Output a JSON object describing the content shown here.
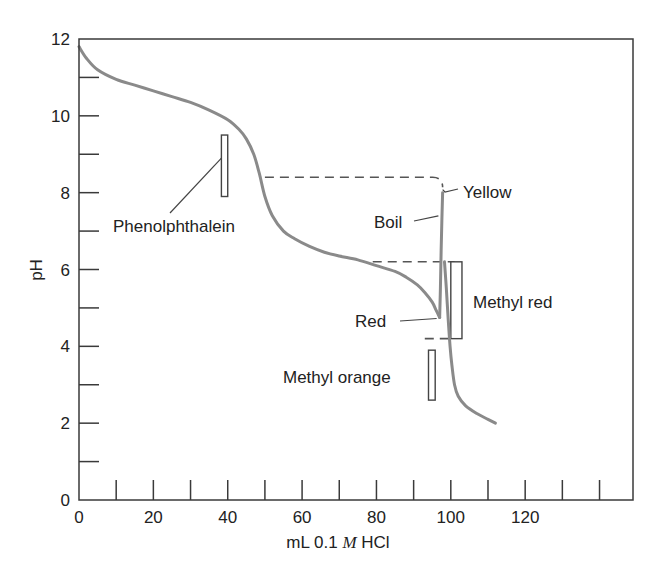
{
  "chart_data": {
    "type": "line",
    "title": "",
    "xlabel_parts": [
      "mL 0.1 ",
      "M",
      " HCl"
    ],
    "xlabel": "mL 0.1 M HCl",
    "ylabel": "pH",
    "xlim": [
      0,
      149
    ],
    "ylim": [
      0,
      12
    ],
    "x_ticks": [
      0,
      10,
      20,
      30,
      40,
      50,
      60,
      70,
      80,
      90,
      100,
      110,
      120,
      130,
      140
    ],
    "x_tick_labels": [
      {
        "value": 0,
        "label": "0"
      },
      {
        "value": 20,
        "label": "20"
      },
      {
        "value": 40,
        "label": "40"
      },
      {
        "value": 60,
        "label": "60"
      },
      {
        "value": 80,
        "label": "80"
      },
      {
        "value": 100,
        "label": "100"
      },
      {
        "value": 120,
        "label": "120"
      }
    ],
    "y_ticks": [
      1,
      2,
      3,
      4,
      5,
      6,
      7,
      8,
      9,
      10,
      11
    ],
    "y_tick_labels": [
      {
        "value": 0,
        "label": "0"
      },
      {
        "value": 2,
        "label": "2"
      },
      {
        "value": 4,
        "label": "4"
      },
      {
        "value": 6,
        "label": "6"
      },
      {
        "value": 8,
        "label": "8"
      },
      {
        "value": 10,
        "label": "10"
      },
      {
        "value": 12,
        "label": "12"
      }
    ],
    "grid": false,
    "series": [
      {
        "name": "titration-curve",
        "x": [
          0,
          2,
          5,
          10,
          15,
          20,
          25,
          30,
          35,
          40,
          43,
          45,
          47,
          48.5,
          50,
          52,
          55,
          58,
          62,
          66,
          70,
          75,
          80,
          85,
          88,
          91,
          93,
          95,
          96,
          97
        ],
        "y": [
          11.8,
          11.5,
          11.2,
          10.95,
          10.8,
          10.65,
          10.5,
          10.35,
          10.15,
          9.9,
          9.65,
          9.4,
          9.0,
          8.5,
          7.9,
          7.4,
          7.0,
          6.8,
          6.6,
          6.45,
          6.35,
          6.25,
          6.1,
          5.95,
          5.8,
          5.6,
          5.4,
          5.15,
          4.95,
          4.75
        ]
      },
      {
        "name": "after-boiling",
        "x": [
          97,
          97.2,
          97.4,
          97.6,
          97.8
        ],
        "y": [
          4.75,
          5.5,
          6.5,
          7.3,
          8.0
        ]
      },
      {
        "name": "final-drop",
        "x": [
          98.3,
          98.8,
          99.3,
          99.8,
          100.3,
          101,
          102,
          104,
          107,
          110,
          112
        ],
        "y": [
          6.2,
          5.5,
          4.7,
          4.0,
          3.5,
          3.0,
          2.7,
          2.45,
          2.25,
          2.1,
          2.0
        ]
      }
    ],
    "dashed_lines": [
      {
        "name": "phenolphthalein-endpoint",
        "y": 8.4,
        "x_start": 50,
        "x_end": 97.8
      },
      {
        "name": "methyl-red-upper",
        "y": 6.2,
        "x_start": 79,
        "x_end": 101
      },
      {
        "name": "methyl-red-lower",
        "y": 4.2,
        "x_start": 93,
        "x_end": 100
      }
    ],
    "indicator_ranges": [
      {
        "name": "Phenolphthalein",
        "x": [
          38.3,
          40
        ],
        "pH": [
          7.9,
          9.5
        ]
      },
      {
        "name": "Methyl red",
        "x": [
          100,
          103
        ],
        "pH": [
          4.2,
          6.2
        ]
      },
      {
        "name": "Methyl orange",
        "x": [
          94,
          95.8
        ],
        "pH": [
          2.6,
          3.9
        ]
      }
    ],
    "annotations": [
      {
        "text": "Phenolphthalein",
        "points_to": [
          38.3,
          8.9
        ]
      },
      {
        "text": "Yellow",
        "points_to": [
          97.8,
          8.0
        ]
      },
      {
        "text": "Boil",
        "points_to": [
          97.2,
          7.5
        ]
      },
      {
        "text": "Methyl red"
      },
      {
        "text": "Red",
        "points_to": [
          97,
          4.75
        ]
      },
      {
        "text": "Methyl orange"
      }
    ]
  }
}
